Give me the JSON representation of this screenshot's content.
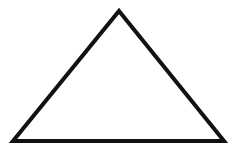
{
  "canvas": {
    "width": 233,
    "height": 149,
    "background_color": "#ffffff",
    "name": "triangle-outline-figure"
  },
  "figure": {
    "shape_name": "triangle",
    "shape_kind": "isosceles-triangle",
    "label": "",
    "filled": false,
    "fill_color": "none",
    "stroke_color": "#111111",
    "stroke_width": 4,
    "stroke_linejoin": "miter",
    "vertices": [
      {
        "name": "apex",
        "x": 119,
        "y": 11
      },
      {
        "name": "bottom-right",
        "x": 224,
        "y": 141
      },
      {
        "name": "bottom-left",
        "x": 13,
        "y": 141
      }
    ],
    "points_attr": "119,11 224,141 13,141",
    "edges": [
      {
        "name": "left-edge",
        "from": "bottom-left",
        "to": "apex"
      },
      {
        "name": "right-edge",
        "from": "apex",
        "to": "bottom-right"
      },
      {
        "name": "base-edge",
        "from": "bottom-left",
        "to": "bottom-right"
      }
    ],
    "measurements": {
      "base_length_px": 211,
      "height_px": 130,
      "apex_center_x": 119
    }
  }
}
